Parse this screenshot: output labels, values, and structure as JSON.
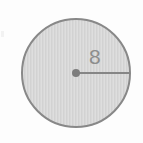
{
  "figure": {
    "type": "geometry-diagram",
    "shape_name": "circle",
    "background_color": "#fdfdfd",
    "circle": {
      "center_x": 76,
      "center_y": 73,
      "radius": 55,
      "fill_color": "#d6d6d6",
      "stroke_color": "#888888",
      "stroke_width": 2
    },
    "center_point": {
      "label": "",
      "x": 76,
      "y": 73,
      "dot_radius": 4,
      "color": "#7d7d7d"
    },
    "radius_segment": {
      "from_x": 76,
      "from_y": 73,
      "to_x": 131,
      "to_y": 73,
      "color": "#868686",
      "stroke_width": 2
    },
    "labels": {
      "radius_value": "8",
      "radius_label_x": 97,
      "radius_label_y": 48,
      "radius_label_color": "#8d8d8d"
    },
    "artifact": {
      "present": true,
      "x": 1,
      "y": 31,
      "width": 3,
      "height": 6
    }
  }
}
